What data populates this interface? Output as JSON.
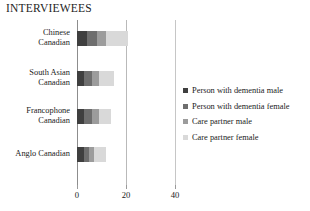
{
  "chart_data": {
    "type": "bar",
    "orientation": "horizontal",
    "stacked": true,
    "title": "INTERVIEWEES",
    "xlabel": "",
    "ylabel": "",
    "xlim": [
      0,
      40
    ],
    "xticks": [
      0,
      20,
      40
    ],
    "xtick_labels": [
      "0",
      "20",
      "40"
    ],
    "grid": false,
    "legend_position": "right",
    "categories": [
      "Chinese Canadian",
      "South Asian Canadian",
      "Francophone Canadian",
      "Anglo Canadian"
    ],
    "category_lines": [
      [
        "Chinese",
        "Canadian"
      ],
      [
        "South Asian",
        "Canadian"
      ],
      [
        "Francophone",
        "Canadian"
      ],
      [
        "Anglo Canadian"
      ]
    ],
    "series": [
      {
        "name": "Person with dementia male",
        "color": "#3f3f3f",
        "values": [
          4,
          3,
          3,
          3
        ]
      },
      {
        "name": "Person with dementia female",
        "color": "#6e6e6e",
        "values": [
          4,
          3,
          3,
          2
        ]
      },
      {
        "name": "Care partner male",
        "color": "#9c9c9c",
        "values": [
          4,
          3,
          3,
          2
        ]
      },
      {
        "name": "Care partner female",
        "color": "#d9d9d9",
        "values": [
          9,
          6,
          5,
          5
        ]
      }
    ],
    "totals": [
      21,
      15,
      14,
      12
    ]
  },
  "axis": {
    "tick_0": "0",
    "tick_20": "20",
    "tick_40": "40"
  }
}
